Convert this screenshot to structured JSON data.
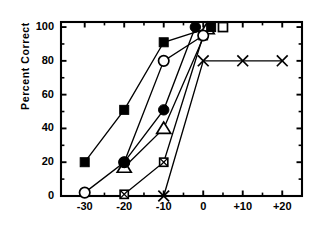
{
  "chart_data": {
    "type": "line",
    "title": "",
    "subtitle": "",
    "xlabel": "",
    "ylabel": "Percent Correct",
    "xlim": [
      -36,
      25
    ],
    "ylim": [
      0,
      103
    ],
    "grid": false,
    "legend": "none",
    "y_ticks": [
      0,
      20,
      40,
      60,
      80,
      100
    ],
    "y_tick_labels": [
      "0",
      "20",
      "40",
      "60",
      "80",
      "100"
    ],
    "y_minor_ticks": [
      10,
      30,
      50,
      70,
      90
    ],
    "x_ticks": [
      -30,
      -20,
      -10,
      0,
      10,
      20
    ],
    "x_tick_labels": [
      "-30",
      "-20",
      "-10",
      "0",
      "+10",
      "+20"
    ],
    "x_minor_ticks": [
      -25,
      -15,
      -5,
      5,
      15
    ],
    "series": [
      {
        "name": "filled-square",
        "marker": "filled-square",
        "points": [
          {
            "x": -30,
            "y": 20
          },
          {
            "x": -20,
            "y": 51
          },
          {
            "x": -10,
            "y": 91
          },
          {
            "x": 2,
            "y": 100
          }
        ]
      },
      {
        "name": "open-circle",
        "marker": "open-circle",
        "points": [
          {
            "x": -30,
            "y": 2
          },
          {
            "x": -20,
            "y": 20
          },
          {
            "x": -10,
            "y": 80
          },
          {
            "x": 0,
            "y": 95
          }
        ]
      },
      {
        "name": "filled-circle",
        "marker": "filled-circle",
        "points": [
          {
            "x": -20,
            "y": 20
          },
          {
            "x": -10,
            "y": 51
          },
          {
            "x": -2,
            "y": 100
          }
        ]
      },
      {
        "name": "open-triangle",
        "marker": "open-triangle",
        "points": [
          {
            "x": -20,
            "y": 17
          },
          {
            "x": -10,
            "y": 40
          },
          {
            "x": 1,
            "y": 99
          }
        ]
      },
      {
        "name": "crossed-square",
        "marker": "crossed-square",
        "points": [
          {
            "x": -20,
            "y": 1
          },
          {
            "x": -10,
            "y": 20
          },
          {
            "x": 0,
            "y": 95
          }
        ]
      },
      {
        "name": "open-square",
        "marker": "open-square",
        "points": [
          {
            "x": 5,
            "y": 100
          }
        ]
      },
      {
        "name": "cross-x",
        "marker": "cross-x",
        "points": [
          {
            "x": -10,
            "y": 0
          },
          {
            "x": 0,
            "y": 80
          },
          {
            "x": 10,
            "y": 80
          },
          {
            "x": 20,
            "y": 80
          }
        ]
      }
    ],
    "colors": {
      "axis": "#000000",
      "marker_fill": "#000000",
      "marker_open": "#ffffff",
      "line": "#000000",
      "background": "#ffffff"
    }
  }
}
